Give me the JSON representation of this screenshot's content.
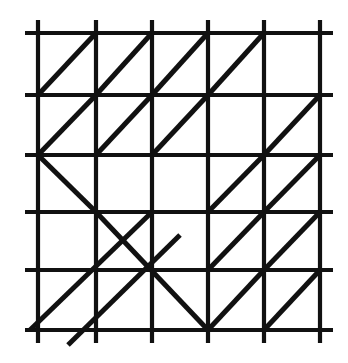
{
  "figure": {
    "type": "line-diagram",
    "background_color": "#ffffff",
    "line_color": "#111111"
  },
  "diagram_data": {
    "type": "lattice-diagram",
    "description": "A 5x5 square grid whose lines overhang the border, overlaid with diagonal segments inside selected cells.",
    "canvas": {
      "width": 348,
      "height": 363
    },
    "grid": {
      "columns": 5,
      "rows": 5,
      "vertical_line_x": [
        38,
        96,
        152,
        208,
        264,
        320
      ],
      "horizontal_line_y": [
        33,
        95,
        155,
        212,
        270,
        330
      ],
      "overhang_px": 13,
      "stroke_width": 4.2,
      "stroke_color": "#111111"
    },
    "diagonals": {
      "stroke_width": 5.0,
      "stroke_color": "#111111",
      "legend": {
        "slash": "diagonal from bottom-left corner to top-right corner",
        "backslash": "diagonal from top-left corner to bottom-right corner"
      },
      "cell_map": [
        [
          "/",
          "/",
          "/",
          "/",
          ""
        ],
        [
          "/",
          "/",
          "/",
          "",
          "/"
        ],
        [
          "\\",
          "",
          "",
          "/",
          "/"
        ],
        [
          "",
          "\\",
          "",
          "/",
          "/"
        ],
        [
          "/",
          "/",
          "\\",
          "/",
          "/"
        ]
      ],
      "segments": [
        {
          "name": "r1c1-slash",
          "x1": 38,
          "y1": 95,
          "x2": 96,
          "y2": 33
        },
        {
          "name": "r1c2-slash",
          "x1": 96,
          "y1": 95,
          "x2": 152,
          "y2": 33
        },
        {
          "name": "r1c3-slash",
          "x1": 152,
          "y1": 95,
          "x2": 208,
          "y2": 33
        },
        {
          "name": "r1c4-slash",
          "x1": 208,
          "y1": 95,
          "x2": 264,
          "y2": 33
        },
        {
          "name": "r2c1-slash",
          "x1": 38,
          "y1": 155,
          "x2": 96,
          "y2": 95
        },
        {
          "name": "r2c2-slash",
          "x1": 96,
          "y1": 155,
          "x2": 152,
          "y2": 95
        },
        {
          "name": "r2c3-slash",
          "x1": 152,
          "y1": 155,
          "x2": 208,
          "y2": 95
        },
        {
          "name": "r2c5-slash",
          "x1": 264,
          "y1": 155,
          "x2": 320,
          "y2": 95
        },
        {
          "name": "r3c1-backslash",
          "x1": 38,
          "y1": 155,
          "x2": 96,
          "y2": 212
        },
        {
          "name": "r3c4-slash",
          "x1": 208,
          "y1": 212,
          "x2": 264,
          "y2": 155
        },
        {
          "name": "r3c5-slash",
          "x1": 264,
          "y1": 212,
          "x2": 320,
          "y2": 155
        },
        {
          "name": "r4r5-long-backslash",
          "x1": 96,
          "y1": 212,
          "x2": 208,
          "y2": 330
        },
        {
          "name": "band-upper-slash",
          "x1": 30,
          "y1": 330,
          "x2": 152,
          "y2": 212
        },
        {
          "name": "band-lower-slash",
          "x1": 68,
          "y1": 345,
          "x2": 180,
          "y2": 235
        },
        {
          "name": "r4c4-slash",
          "x1": 208,
          "y1": 270,
          "x2": 264,
          "y2": 212
        },
        {
          "name": "r4c5-slash",
          "x1": 264,
          "y1": 270,
          "x2": 320,
          "y2": 212
        },
        {
          "name": "r5c4-slash",
          "x1": 208,
          "y1": 330,
          "x2": 264,
          "y2": 270
        },
        {
          "name": "r5c5-slash",
          "x1": 264,
          "y1": 330,
          "x2": 320,
          "y2": 270
        }
      ]
    }
  }
}
